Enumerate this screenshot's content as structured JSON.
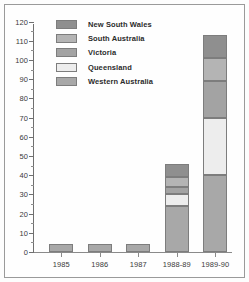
{
  "chart_data": {
    "type": "bar",
    "subtype": "stacked-bar",
    "title": "",
    "xlabel": "",
    "ylabel": "",
    "categories": [
      "1985",
      "1986",
      "1987",
      "1988-89",
      "1989-90"
    ],
    "ylim": [
      0,
      125
    ],
    "yticks": [
      0,
      10,
      20,
      30,
      40,
      50,
      60,
      70,
      80,
      90,
      100,
      110,
      120
    ],
    "ytick_labels": [
      "0",
      "10",
      "20",
      "30",
      "40",
      "50",
      "60",
      "70",
      "80",
      "90",
      "100",
      "110",
      "120"
    ],
    "grid": false,
    "legend_position": "upper-left",
    "series": [
      {
        "name": "New South Wales",
        "color": "#8f8f8f",
        "values": [
          0,
          0,
          0,
          7,
          12
        ]
      },
      {
        "name": "South Australia",
        "color": "#b4b4b4",
        "values": [
          0,
          0,
          0,
          5,
          12
        ]
      },
      {
        "name": "Victoria",
        "color": "#a3a3a3",
        "values": [
          0,
          0,
          0,
          4,
          19
        ]
      },
      {
        "name": "Queensland",
        "color": "#ededed",
        "values": [
          0,
          0,
          0,
          6,
          30
        ]
      },
      {
        "name": "Western Australia",
        "color": "#a8a8a8",
        "values": [
          4,
          4,
          4,
          24,
          40
        ]
      }
    ],
    "totals": [
      4,
      4,
      4,
      46,
      113
    ]
  },
  "legend": {
    "items": [
      {
        "label": "New South Wales",
        "color": "#8f8f8f"
      },
      {
        "label": "South Australia",
        "color": "#b4b4b4"
      },
      {
        "label": "Victoria",
        "color": "#a3a3a3"
      },
      {
        "label": "Queensland",
        "color": "#ededed"
      },
      {
        "label": "Western Australia",
        "color": "#a8a8a8"
      }
    ]
  },
  "axes": {
    "y_max": 125,
    "y_tick_step": 10
  }
}
